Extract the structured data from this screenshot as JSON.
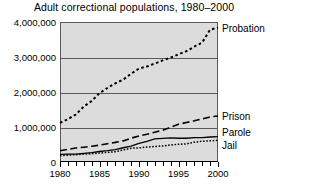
{
  "chart_data": {
    "type": "line",
    "title": "Adult correctional populations, 1980–2000",
    "xlabel": "",
    "ylabel": "",
    "xlim": [
      1980,
      2000
    ],
    "ylim": [
      0,
      4000000
    ],
    "grid": true,
    "legend_position": "right-of-plot-at-series-end",
    "x": [
      1980,
      1981,
      1982,
      1983,
      1984,
      1985,
      1986,
      1987,
      1988,
      1989,
      1990,
      1991,
      1992,
      1993,
      1994,
      1995,
      1996,
      1997,
      1998,
      1999,
      2000
    ],
    "ytick_labels": [
      "0",
      "1,000,000",
      "2,000,000",
      "3,000,000",
      "4,000,000"
    ],
    "ytick_values": [
      0,
      1000000,
      2000000,
      3000000,
      4000000
    ],
    "xtick_labels": [
      "1980",
      "1985",
      "1990",
      "1995",
      "2000"
    ],
    "xtick_values": [
      1980,
      1985,
      1990,
      1995,
      2000
    ],
    "series": [
      {
        "name": "Probation",
        "style": "dotted-heavy",
        "values": [
          1118000,
          1225000,
          1357000,
          1582000,
          1740000,
          1969000,
          2114000,
          2248000,
          2356000,
          2522000,
          2670000,
          2729000,
          2812000,
          2903000,
          2981000,
          3078000,
          3165000,
          3297000,
          3417000,
          3779000,
          3840000
        ]
      },
      {
        "name": "Prison",
        "style": "dashed",
        "values": [
          320000,
          360000,
          402000,
          423000,
          448000,
          480000,
          523000,
          560000,
          603000,
          680000,
          743000,
          792000,
          850000,
          909000,
          990000,
          1078000,
          1127000,
          1176000,
          1232000,
          1287000,
          1316000
        ]
      },
      {
        "name": "Parole",
        "style": "solid",
        "values": [
          220000,
          225000,
          224000,
          246000,
          266000,
          300000,
          325000,
          355000,
          407000,
          456000,
          531000,
          590000,
          658000,
          676000,
          690000,
          679000,
          679000,
          694000,
          696000,
          714000,
          725000
        ]
      },
      {
        "name": "Jail",
        "style": "dotted-fine",
        "values": [
          182000,
          196000,
          209000,
          223000,
          234000,
          256000,
          274000,
          295000,
          343000,
          395000,
          405000,
          426000,
          444000,
          459000,
          486000,
          507000,
          518000,
          567000,
          592000,
          605000,
          621000
        ]
      }
    ]
  },
  "colors": {
    "plot_background": "#dcdcdc",
    "page_background": "#ffffff",
    "axis": "#000000",
    "gridline": "#5a5a5a",
    "series": "#000000"
  }
}
